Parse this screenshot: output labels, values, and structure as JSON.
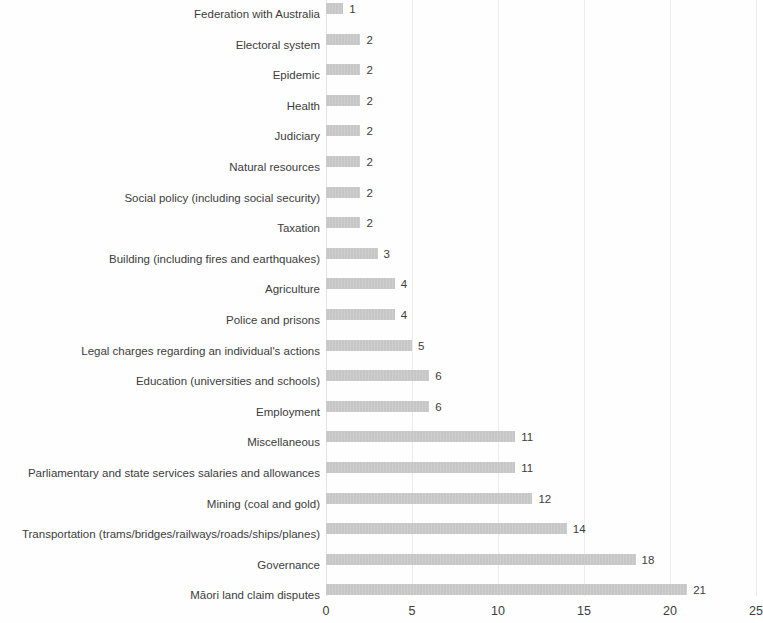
{
  "chart_data": {
    "type": "bar",
    "orientation": "horizontal",
    "title": "",
    "subtitle": "",
    "xlabel": "",
    "ylabel": "",
    "xlim": [
      0,
      25
    ],
    "ylim": null,
    "grid": true,
    "grid_axis": "x",
    "legend": false,
    "legend_position": "none",
    "bar_color": "#b4b4b4",
    "text_color": "#3c3c3c",
    "background_color": "#fefefe",
    "x_ticks": [
      0,
      5,
      10,
      15,
      20,
      25
    ],
    "x_tick_labels": [
      "0",
      "5",
      "10",
      "15",
      "20",
      "25"
    ],
    "categories": [
      "Federation with Australia",
      "Electoral system",
      "Epidemic",
      "Health",
      "Judiciary",
      "Natural resources",
      "Social policy (including social security)",
      "Taxation",
      "Building (including fires and earthquakes)",
      "Agriculture",
      "Police and prisons",
      "Legal charges regarding an individual's actions",
      "Education (universities and schools)",
      "Employment",
      "Miscellaneous",
      "Parliamentary and state services salaries and allowances",
      "Mining (coal and gold)",
      "Transportation (trams/bridges/railways/roads/ships/planes)",
      "Governance",
      "Māori land claim disputes"
    ],
    "values": [
      1,
      2,
      2,
      2,
      2,
      2,
      2,
      2,
      3,
      4,
      4,
      5,
      6,
      6,
      11,
      11,
      12,
      14,
      18,
      21
    ],
    "value_labels": [
      "1",
      "2",
      "2",
      "2",
      "2",
      "2",
      "2",
      "2",
      "3",
      "4",
      "4",
      "5",
      "6",
      "6",
      "11",
      "11",
      "12",
      "14",
      "18",
      "21"
    ]
  }
}
